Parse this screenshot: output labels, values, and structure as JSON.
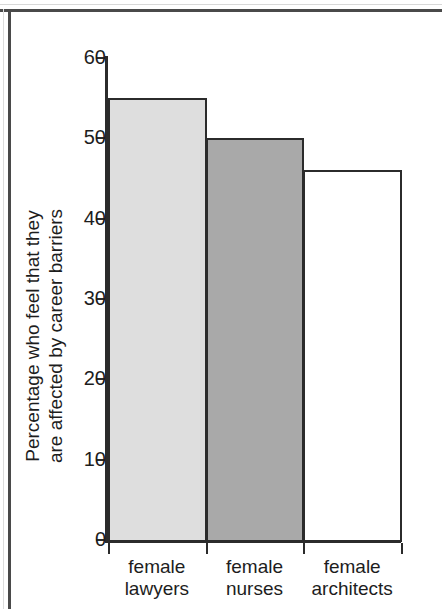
{
  "chart_data": {
    "type": "bar",
    "title": "",
    "subtitle": "",
    "xlabel": "",
    "ylabel": "Percentage who feel that they are affected by career barriers",
    "ylabel_line1": "Percentage who feel that they",
    "ylabel_line2": "are affected by career barriers",
    "categories": [
      "female lawyers",
      "female nurses",
      "female architects"
    ],
    "category_lines": [
      {
        "line1": "female",
        "line2": "lawyers"
      },
      {
        "line1": "female",
        "line2": "nurses"
      },
      {
        "line1": "female",
        "line2": "architects"
      }
    ],
    "values": [
      55,
      50,
      46
    ],
    "ylim": [
      0,
      60
    ],
    "yticks": [
      0,
      10,
      20,
      30,
      40,
      50,
      60
    ],
    "ytick_labels": [
      "0",
      "10",
      "20",
      "30",
      "40",
      "50",
      "60"
    ],
    "grid": false,
    "legend": null,
    "bar_colors": [
      "#dedede",
      "#a9a9a9",
      "#ffffff"
    ],
    "bar_edge_color": "#2b2b2b",
    "axis_color": "#2b2b2b",
    "text_color": "#1d1d1d",
    "background_color": "#ffffff",
    "page_frame_color": "#4a4a4a"
  }
}
